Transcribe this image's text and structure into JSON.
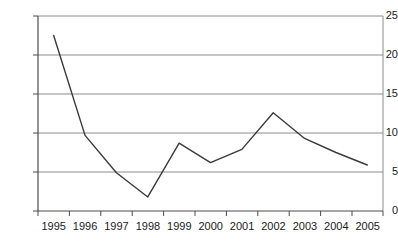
{
  "chart_data": {
    "type": "line",
    "title": "",
    "subtitle": "",
    "xlabel": "",
    "ylabel": "",
    "categories": [
      "1995",
      "1996",
      "1997",
      "1998",
      "1999",
      "2000",
      "2001",
      "2002",
      "2003",
      "2004",
      "2005"
    ],
    "values": [
      22.5,
      9.7,
      4.9,
      1.8,
      8.7,
      6.2,
      7.9,
      12.6,
      9.3,
      7.5,
      5.9
    ],
    "series": [
      {
        "name": "",
        "values": [
          22.5,
          9.7,
          4.9,
          1.8,
          8.7,
          6.2,
          7.9,
          12.6,
          9.3,
          7.5,
          5.9
        ]
      }
    ],
    "ylim": [
      0,
      25
    ],
    "yticks": [
      0,
      5,
      10,
      15,
      20,
      25
    ],
    "ytick_labels": [
      "0",
      "5",
      "10",
      "15",
      "20",
      "25"
    ],
    "xtick_labels": [
      "1995",
      "1996",
      "1997",
      "1998",
      "1999",
      "2000",
      "2001",
      "2002",
      "2003",
      "2004",
      "2005"
    ],
    "grid": "horizontal",
    "legend": "none",
    "line_color": "#3a3a3a",
    "grid_color": "#9a9a9a",
    "axis_color": "#555555",
    "background_color": "#ffffff",
    "markers": "none",
    "annotations": []
  },
  "axes": {
    "y_tick_0": "0",
    "y_tick_1": "5",
    "y_tick_2": "10",
    "y_tick_3": "15",
    "y_tick_4": "20",
    "y_tick_5": "25",
    "x_tick_0": "1995",
    "x_tick_1": "1996",
    "x_tick_2": "1997",
    "x_tick_3": "1998",
    "x_tick_4": "1999",
    "x_tick_5": "2000",
    "x_tick_6": "2001",
    "x_tick_7": "2002",
    "x_tick_8": "2003",
    "x_tick_9": "2004",
    "x_tick_10": "2005"
  }
}
